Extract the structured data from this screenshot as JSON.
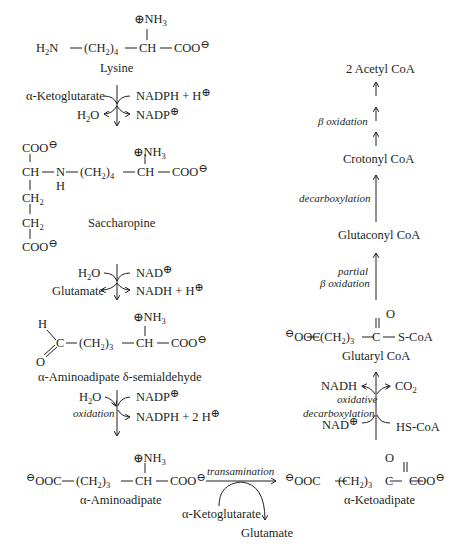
{
  "diagram": {
    "left_column": {
      "lysine": {
        "formula_left": "H2N",
        "chain": "(CH2)4",
        "ch": "CH",
        "coo": "COO",
        "nh3": "NH3",
        "name": "Lysine"
      },
      "step1": {
        "in_left": "α-Ketoglutarate",
        "in_right": "NADPH + H",
        "out_left": "H2O",
        "out_right": "NADP"
      },
      "saccharopine": {
        "name": "Saccharopine",
        "groups": [
          "COO",
          "CH",
          "N",
          "H",
          "CH2",
          "CH2",
          "COO",
          "(CH2)4",
          "CH",
          "COO",
          "NH3"
        ]
      },
      "step2": {
        "in_left": "H2O",
        "in_right": "NAD",
        "out_left": "Glutamate",
        "out_right": "NADH + H"
      },
      "semialdehyde": {
        "name": "α-Aminoadipate δ-semialdehyde",
        "groups": [
          "H",
          "C",
          "O",
          "(CH2)3",
          "CH",
          "COO",
          "NH3"
        ]
      },
      "step3": {
        "in_left": "H2O",
        "in_right": "NADP",
        "label": "oxidation",
        "out_right": "NADPH + 2 H"
      },
      "aminoadipate": {
        "name": "α-Aminoadipate",
        "groups": [
          "OOC",
          "(CH2)3",
          "CH",
          "COO",
          "NH3"
        ]
      }
    },
    "transamination": {
      "label": "transamination",
      "in": "α-Ketoglutarate",
      "out": "Glutamate"
    },
    "right_column": {
      "ketoadipate": {
        "name": "α-Ketoadipate",
        "groups": [
          "OOC",
          "(CH2)3",
          "C",
          "O",
          "COO"
        ]
      },
      "step4": {
        "label_line1": "oxidative",
        "label_line2": "decarboxylation",
        "in_left": "NAD",
        "in_right": "HS-CoA",
        "out_left": "NADH",
        "out_right": "CO2"
      },
      "glutaryl_coa": {
        "name": "Glutaryl CoA",
        "groups": [
          "OOC",
          "(CH2)3",
          "C",
          "O",
          "S-CoA"
        ]
      },
      "step5": {
        "label_line1": "partial",
        "label_line2": "β oxidation"
      },
      "glutaconyl_coa": {
        "name": "Glutaconyl CoA"
      },
      "step6": {
        "label": "decarboxylation"
      },
      "crotonyl_coa": {
        "name": "Crotonyl CoA"
      },
      "step7": {
        "label": "β oxidation"
      },
      "acetyl_coa": {
        "name": "2 Acetyl CoA"
      }
    },
    "symbols": {
      "plus": "⊕",
      "minus": "⊖"
    }
  }
}
